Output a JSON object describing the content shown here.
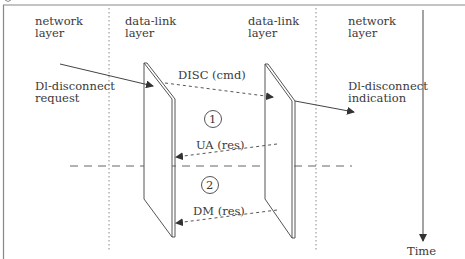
{
  "diagram": {
    "type": "sequence-timing",
    "columns": [
      {
        "id": "net-left",
        "line1": "network",
        "line2": "layer"
      },
      {
        "id": "dl-left",
        "line1": "data-link",
        "line2": "layer"
      },
      {
        "id": "dl-right",
        "line1": "data-link",
        "line2": "layer"
      },
      {
        "id": "net-right",
        "line1": "network",
        "line2": "layer"
      }
    ],
    "primitives": {
      "request": {
        "line1": "Dl-disconnect",
        "line2": "request"
      },
      "indication": {
        "line1": "Dl-disconnect",
        "line2": "indication"
      }
    },
    "messages": {
      "disc": "DISC (cmd)",
      "ua": "UA (res)",
      "dm": "DM (res)"
    },
    "cases": {
      "case1": "1",
      "case2": "2"
    },
    "time_label": "Time",
    "colors": {
      "line": "#555555",
      "text": "#3a3a3a",
      "background": "#ffffff"
    }
  }
}
